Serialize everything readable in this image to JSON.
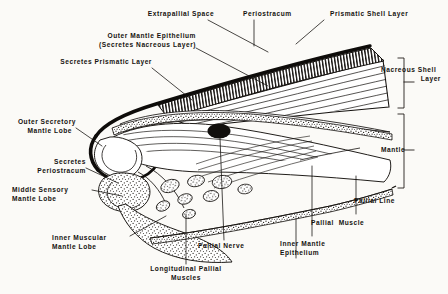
{
  "figure": {
    "background_color": "#fbfaf7",
    "ink_color": "#15120f"
  },
  "labels": {
    "extrapallial_space": "Extrapallial Space",
    "periostracum_top": "Periostracum",
    "prismatic_shell_layer": "Prismatic Shell Layer",
    "outer_mantle_epithelium_l1": "Outer Mantle Epithelium",
    "outer_mantle_epithelium_l2": "(Secretes Nacreous Layer)",
    "secretes_prismatic_layer": "Secretes Prismatic Layer",
    "nacreous_shell_layer_l1": "Nacreous Shell",
    "nacreous_shell_layer_l2": "Layer",
    "mantle": "Mantle",
    "outer_secretory_mantle_lobe_l1": "Outer Secretory",
    "outer_secretory_mantle_lobe_l2": "Mantle Lobe",
    "secretes_periostracum_l1": "Secretes",
    "secretes_periostracum_l2": "Periostracum",
    "middle_sensory_mantle_lobe_l1": "Middle Sensory",
    "middle_sensory_mantle_lobe_l2": "Mantle Lobe",
    "inner_muscular_mantle_lobe_l1": "Inner Muscular",
    "inner_muscular_mantle_lobe_l2": "Mantle Lobe",
    "longitudinal_pallial_muscles_l1": "Longitudinal Pallial",
    "longitudinal_pallial_muscles_l2": "Muscles",
    "pallial_nerve": "Pallial Nerve",
    "inner_mantle_epithelium_l1": "Inner Mantle",
    "inner_mantle_epithelium_l2": "Epithelium",
    "pallial_muscle": "Pallial  Muscle",
    "pallial_line": "Pallial Line"
  },
  "structures": {
    "periostracum_name": "periostracum-layer",
    "prismatic_name": "prismatic-shell-layer",
    "nacreous_name": "nacreous-shell-layer",
    "extrapallial_name": "extrapallial-space",
    "outer_epithelium_name": "outer-mantle-epithelium",
    "inner_epithelium_name": "inner-mantle-epithelium",
    "pallial_nerve_name": "pallial-nerve-section",
    "longitudinal_muscle_name": "longitudinal-muscle-bundles",
    "outer_lobe_name": "outer-secretory-mantle-lobe",
    "middle_lobe_name": "middle-sensory-mantle-lobe",
    "inner_lobe_name": "inner-muscular-mantle-lobe"
  }
}
